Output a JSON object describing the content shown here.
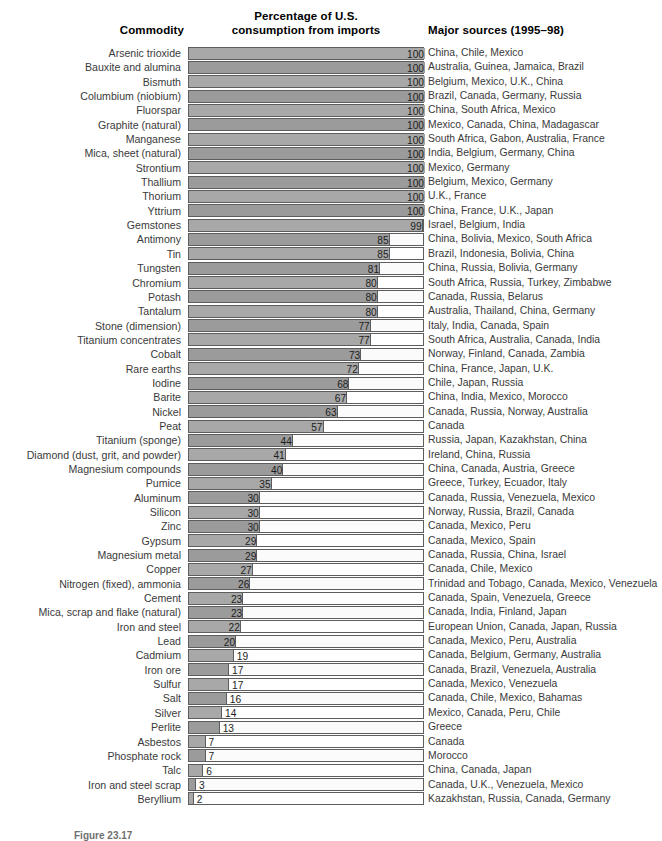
{
  "header": {
    "commodity": "Commodity",
    "percent_line1": "Percentage of U.S.",
    "percent_line2": "consumption from imports",
    "sources": "Major sources (1995–98)"
  },
  "caption": "Figure 23.17",
  "colors": {
    "bar_light": "#a8a8a8",
    "bar_dark": "#9b9b9b",
    "border": "#5d5d5d",
    "track": "#ffffff",
    "label_text": "#3a3a3a",
    "header_text": "#000000"
  },
  "chart_data": {
    "type": "bar",
    "orientation": "horizontal",
    "title": "Percentage of U.S. consumption from imports",
    "xlabel": "Percentage of U.S. consumption from imports",
    "ylabel": "Commodity",
    "xlim": [
      0,
      100
    ],
    "grid": false,
    "legend": "none",
    "categories": [
      "Arsenic trioxide",
      "Bauxite and alumina",
      "Bismuth",
      "Columbium (niobium)",
      "Fluorspar",
      "Graphite (natural)",
      "Manganese",
      "Mica, sheet (natural)",
      "Strontium",
      "Thallium",
      "Thorium",
      "Yttrium",
      "Gemstones",
      "Antimony",
      "Tin",
      "Tungsten",
      "Chromium",
      "Potash",
      "Tantalum",
      "Stone (dimension)",
      "Titanium concentrates",
      "Cobalt",
      "Rare earths",
      "Iodine",
      "Barite",
      "Nickel",
      "Peat",
      "Titanium (sponge)",
      "Diamond (dust, grit, and powder)",
      "Magnesium compounds",
      "Pumice",
      "Aluminum",
      "Silicon",
      "Zinc",
      "Gypsum",
      "Magnesium metal",
      "Copper",
      "Nitrogen (fixed), ammonia",
      "Cement",
      "Mica, scrap and flake (natural)",
      "Iron and steel",
      "Lead",
      "Cadmium",
      "Iron ore",
      "Sulfur",
      "Salt",
      "Silver",
      "Perlite",
      "Asbestos",
      "Phosphate rock",
      "Talc",
      "Iron and steel scrap",
      "Beryllium"
    ],
    "values": [
      100,
      100,
      100,
      100,
      100,
      100,
      100,
      100,
      100,
      100,
      100,
      100,
      99,
      85,
      85,
      81,
      80,
      80,
      80,
      77,
      77,
      73,
      72,
      68,
      67,
      63,
      57,
      44,
      41,
      40,
      35,
      30,
      30,
      30,
      29,
      29,
      27,
      26,
      23,
      23,
      22,
      20,
      19,
      17,
      17,
      16,
      14,
      13,
      7,
      7,
      6,
      3,
      2
    ],
    "annotations": [
      "China, Chile, Mexico",
      "Australia, Guinea, Jamaica, Brazil",
      "Belgium, Mexico, U.K., China",
      "Brazil, Canada, Germany, Russia",
      "China, South Africa, Mexico",
      "Mexico, Canada, China, Madagascar",
      "South Africa, Gabon, Australia, France",
      "India, Belgium, Germany, China",
      "Mexico, Germany",
      "Belgium, Mexico, Germany",
      "U.K., France",
      "China, France, U.K., Japan",
      "Israel, Belgium, India",
      "China, Bolivia, Mexico, South Africa",
      "Brazil, Indonesia, Bolivia, China",
      "China, Russia, Bolivia, Germany",
      "South Africa, Russia, Turkey, Zimbabwe",
      "Canada, Russia, Belarus",
      "Australia, Thailand, China, Germany",
      "Italy, India, Canada, Spain",
      "South Africa, Australia, Canada, India",
      "Norway, Finland, Canada, Zambia",
      "China, France, Japan, U.K.",
      "Chile, Japan, Russia",
      "China, India, Mexico, Morocco",
      "Canada, Russia, Norway, Australia",
      "Canada",
      "Russia, Japan, Kazakhstan, China",
      "Ireland, China, Russia",
      "China, Canada, Austria, Greece",
      "Greece, Turkey, Ecuador, Italy",
      "Canada, Russia, Venezuela, Mexico",
      "Norway, Russia, Brazil, Canada",
      "Canada, Mexico, Peru",
      "Canada, Mexico, Spain",
      "Canada, Russia, China, Israel",
      "Canada, Chile, Mexico",
      "Trinidad and Tobago, Canada, Mexico, Venezuela",
      "Canada, Spain, Venezuela, Greece",
      "Canada, India, Finland, Japan",
      "European Union, Canada, Japan, Russia",
      "Canada, Mexico, Peru, Australia",
      "Canada, Belgium, Germany, Australia",
      "Canada, Brazil, Venezuela, Australia",
      "Canada, Mexico, Venezuela",
      "Canada, Chile, Mexico, Bahamas",
      "Mexico, Canada, Peru, Chile",
      "Greece",
      "Canada",
      "Morocco",
      "China, Canada, Japan",
      "Canada, U.K., Venezuela, Mexico",
      "Kazakhstan, Russia, Canada, Germany"
    ]
  }
}
